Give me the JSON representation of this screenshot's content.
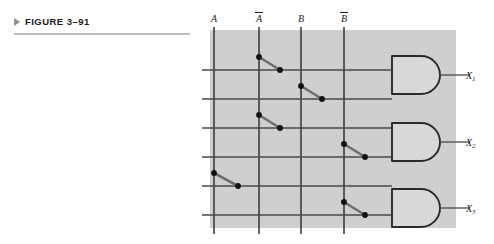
{
  "figure": {
    "marker_icon": "triangle-right-icon",
    "label": "FIGURE 3–91"
  },
  "diagram": {
    "type": "programmable-logic-array",
    "panel": {
      "x": 210,
      "y": 30,
      "width": 246,
      "height": 198,
      "fill": "#cfcfcf"
    },
    "colors": {
      "panel": "#cfcfcf",
      "page": "#ffffff",
      "line": "#4a4a4a",
      "bus": "#3c3c3c",
      "link": "#6e6e6e",
      "dot": "#111111",
      "gate_stroke": "#2b2b2b",
      "gate_fill": "#d8d8d8",
      "rule": "#b9bcc1",
      "marker": "#8a8f96",
      "text": "#1c1c1c"
    },
    "input_columns": [
      {
        "name": "A",
        "label": "A",
        "overbar": false,
        "x": 214
      },
      {
        "name": "Abar",
        "label": "A",
        "overbar": true,
        "x": 259
      },
      {
        "name": "B",
        "label": "B",
        "overbar": false,
        "x": 301
      },
      {
        "name": "Bbar",
        "label": "B",
        "overbar": true,
        "x": 344
      }
    ],
    "product_rows": [
      {
        "row": 1,
        "y": 70,
        "gate": 1,
        "connects": "Abar",
        "from_x": 259,
        "to_x": 280
      },
      {
        "row": 2,
        "y": 99,
        "gate": 1,
        "connects": "B",
        "from_x": 301,
        "to_x": 322
      },
      {
        "row": 3,
        "y": 128,
        "gate": 2,
        "connects": "Abar",
        "from_x": 259,
        "to_x": 280
      },
      {
        "row": 4,
        "y": 157,
        "gate": 2,
        "connects": "Bbar",
        "from_x": 344,
        "to_x": 365
      },
      {
        "row": 5,
        "y": 186,
        "gate": 3,
        "connects": "A",
        "from_x": 214,
        "to_x": 238
      },
      {
        "row": 6,
        "y": 215,
        "gate": 3,
        "connects": "Bbar",
        "from_x": 344,
        "to_x": 365
      }
    ],
    "gates": [
      {
        "id": 1,
        "type": "AND",
        "x": 392,
        "y": 56,
        "width": 48,
        "height": 38,
        "output_label": "X",
        "output_sub": "1",
        "output_y": 75,
        "stub_end": 470,
        "label_x": 466
      },
      {
        "id": 2,
        "type": "AND",
        "x": 392,
        "y": 123,
        "width": 48,
        "height": 38,
        "output_label": "X",
        "output_sub": "2",
        "output_y": 142,
        "stub_end": 470,
        "label_x": 466
      },
      {
        "id": 3,
        "type": "AND",
        "x": 392,
        "y": 189,
        "width": 48,
        "height": 38,
        "output_label": "X",
        "output_sub": "3",
        "output_y": 208,
        "stub_end": 470,
        "label_x": 466
      }
    ],
    "column_label_y": 22,
    "vline_top": 27,
    "vline_bottom": 234,
    "hline_left": 202
  }
}
